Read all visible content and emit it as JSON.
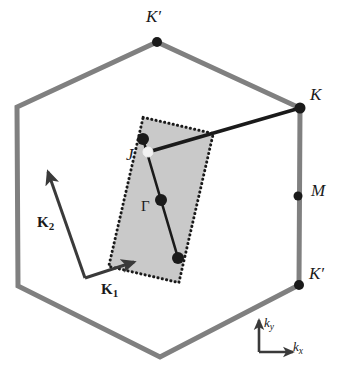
{
  "figure": {
    "background_color": "#ffffff"
  },
  "colors": {
    "hexagon_stroke": "#808080",
    "minizone_fill": "#c9c9c9",
    "minizone_border": "#1a1a1a",
    "line": "#1a1a1a",
    "dot_filled": "#1a1a1a",
    "dot_open": "#f2f2f2",
    "vector": "#3a3a3a",
    "axis": "#3a3a3a",
    "text": "#1a1a1a"
  },
  "hexagon": {
    "name": "first-brillouin-zone",
    "stroke_width": 5,
    "vertices": [
      {
        "x": 157,
        "y": 42
      },
      {
        "x": 300,
        "y": 108
      },
      {
        "x": 299,
        "y": 285
      },
      {
        "x": 160,
        "y": 357
      },
      {
        "x": 18,
        "y": 286
      },
      {
        "x": 17,
        "y": 107
      }
    ]
  },
  "high_symmetry_points": [
    {
      "id": "k-prime-top",
      "label": "K",
      "prime": "′",
      "x": 157,
      "y": 42,
      "label_x": 146,
      "label_y": 8,
      "dot": true,
      "dot_r": 5.0
    },
    {
      "id": "k-right",
      "label": "K",
      "prime": "",
      "x": 300,
      "y": 108,
      "label_x": 310,
      "label_y": 86,
      "dot": true,
      "dot_r": 5.5
    },
    {
      "id": "m-right",
      "label": "M",
      "prime": "",
      "x": 298,
      "y": 196,
      "label_x": 311,
      "label_y": 182,
      "dot": true,
      "dot_r": 4.5
    },
    {
      "id": "k-prime-bottom",
      "label": "K",
      "prime": "′",
      "x": 299,
      "y": 285,
      "label_x": 309,
      "label_y": 265,
      "dot": true,
      "dot_r": 5.0
    }
  ],
  "mini_zone": {
    "name": "folded-mini-brillouin-zone",
    "center": {
      "x": 161,
      "y": 200
    },
    "width": 72,
    "height": 153,
    "rotation_deg": 13,
    "border_style": "dotted",
    "border_width": 3
  },
  "mini_zone_points": [
    {
      "id": "j-top-dot",
      "x": 143,
      "y": 139,
      "r": 6.0,
      "filled": true
    },
    {
      "id": "j-open-dot",
      "x": 148,
      "y": 152,
      "r": 5.0,
      "filled": false
    },
    {
      "id": "gamma-dot",
      "x": 161,
      "y": 200,
      "r": 6.0,
      "filled": true
    },
    {
      "id": "bottom-dot",
      "x": 178,
      "y": 258,
      "r": 6.0,
      "filled": true
    }
  ],
  "mini_zone_axis_line": {
    "x1": 143,
    "y1": 139,
    "x2": 178,
    "y2": 258,
    "width": 2.6
  },
  "gamma_k_line": {
    "x1": 148,
    "y1": 152,
    "x2": 300,
    "y2": 108,
    "width": 3.4
  },
  "point_labels": [
    {
      "id": "label-J",
      "text": "J",
      "x": 126,
      "y": 146,
      "style": "italic"
    },
    {
      "id": "label-Gamma",
      "text": "Γ",
      "x": 141,
      "y": 199,
      "style": "gamma"
    }
  ],
  "lattice_vectors": [
    {
      "id": "vector-K1",
      "label": "K",
      "subscript": "1",
      "origin": {
        "x": 85,
        "y": 278
      },
      "tip": {
        "x": 134,
        "y": 262
      },
      "label_x": 101,
      "label_y": 282
    },
    {
      "id": "vector-K2",
      "label": "K",
      "subscript": "2",
      "origin": {
        "x": 85,
        "y": 278
      },
      "tip": {
        "x": 48,
        "y": 172
      },
      "label_x": 37,
      "label_y": 215
    }
  ],
  "axis_key": {
    "name": "axis-orientation-key",
    "origin": {
      "x": 259,
      "y": 352
    },
    "x_tip": {
      "x": 293,
      "y": 352
    },
    "y_tip": {
      "x": 259,
      "y": 320
    },
    "x_label": {
      "text": "k",
      "subscript": "x",
      "x": 293,
      "y": 340
    },
    "y_label": {
      "text": "k",
      "subscript": "y",
      "x": 264,
      "y": 316
    }
  }
}
